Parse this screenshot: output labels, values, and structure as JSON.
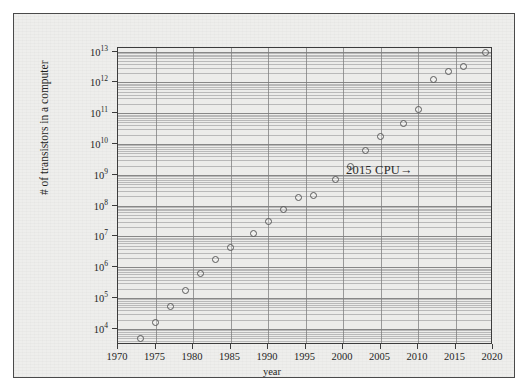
{
  "figure": {
    "background_color": "#eeeeec",
    "frame_color": "#4a4a4a",
    "plot_background_color": "#ececea",
    "grid_color": "#7d7d7d",
    "marker_color": "#5a5a5a",
    "text_color": "#1f1f1f"
  },
  "annotation": {
    "label": "2015 CPU→"
  },
  "axis_labels": {
    "x": "year",
    "y": "# of transistors in a computer"
  },
  "chart_data": {
    "type": "scatter",
    "title": "",
    "xlabel": "year",
    "ylabel": "# of transistors in a computer",
    "xlim": [
      1970,
      2020
    ],
    "ylim": [
      3000,
      13000000000000
    ],
    "yscale": "log",
    "xscale": "linear",
    "grid": true,
    "legend": null,
    "x_ticks": [
      1970,
      1975,
      1980,
      1985,
      1990,
      1995,
      2000,
      2005,
      2010,
      2015,
      2020
    ],
    "x_tick_labels": [
      "1970",
      "1975",
      "1980",
      "1985",
      "1990",
      "1995",
      "2000",
      "2005",
      "2010",
      "2015",
      "2020"
    ],
    "y_ticks": [
      10000,
      100000,
      1000000,
      10000000,
      100000000,
      1000000000,
      10000000000,
      100000000000,
      1000000000000,
      10000000000000
    ],
    "y_tick_labels": [
      "10^4",
      "10^5",
      "10^6",
      "10^7",
      "10^8",
      "10^9",
      "10^10",
      "10^11",
      "10^12",
      "10^13"
    ],
    "y_tick_mantissas": [
      "10",
      "10",
      "10",
      "10",
      "10",
      "10",
      "10",
      "10",
      "10",
      "10"
    ],
    "y_tick_exponents": [
      "4",
      "5",
      "6",
      "7",
      "8",
      "9",
      "10",
      "11",
      "12",
      "13"
    ],
    "annotations": [
      {
        "text": "2015 CPU→",
        "points_to_x": 2012,
        "points_to_y": 1200000000
      }
    ],
    "points": [
      {
        "x": 1971,
        "y": 2300
      },
      {
        "x": 1973,
        "y": 5000
      },
      {
        "x": 1975,
        "y": 16000
      },
      {
        "x": 1977,
        "y": 55000
      },
      {
        "x": 1979,
        "y": 180000
      },
      {
        "x": 1981,
        "y": 620000
      },
      {
        "x": 1983,
        "y": 1800000
      },
      {
        "x": 1985,
        "y": 4500000
      },
      {
        "x": 1988,
        "y": 12000000
      },
      {
        "x": 1990,
        "y": 30000000
      },
      {
        "x": 1992,
        "y": 75000000
      },
      {
        "x": 1994,
        "y": 180000000
      },
      {
        "x": 1996,
        "y": 210000000
      },
      {
        "x": 1999,
        "y": 700000000
      },
      {
        "x": 2001,
        "y": 1800000000
      },
      {
        "x": 2003,
        "y": 6000000000
      },
      {
        "x": 2005,
        "y": 17000000000
      },
      {
        "x": 2008,
        "y": 45000000000
      },
      {
        "x": 2010,
        "y": 130000000000
      },
      {
        "x": 2012,
        "y": 1200000000000
      },
      {
        "x": 2014,
        "y": 2200000000000
      },
      {
        "x": 2016,
        "y": 3200000000000
      },
      {
        "x": 2019,
        "y": 9000000000000
      }
    ]
  }
}
